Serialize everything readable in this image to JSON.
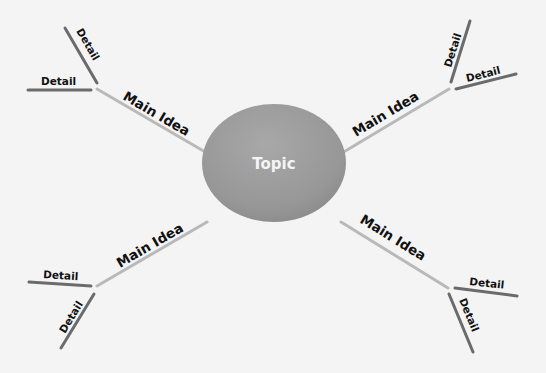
{
  "topic": {
    "label": "Topic",
    "color": "#9a9a9a"
  },
  "branches": [
    {
      "position": "top-left",
      "main_label": "Main Idea",
      "details": [
        "Detail",
        "Detail"
      ]
    },
    {
      "position": "top-right",
      "main_label": "Main Idea",
      "details": [
        "Detail",
        "Detail"
      ]
    },
    {
      "position": "bottom-left",
      "main_label": "Main Idea",
      "details": [
        "Detail",
        "Detail"
      ]
    },
    {
      "position": "bottom-right",
      "main_label": "Main Idea",
      "details": [
        "Detail",
        "Detail"
      ]
    }
  ],
  "colors": {
    "background": "#f4f4f4",
    "main_line": "#b9b9b9",
    "detail_line": "#6b6b6b",
    "text": "#111111"
  }
}
